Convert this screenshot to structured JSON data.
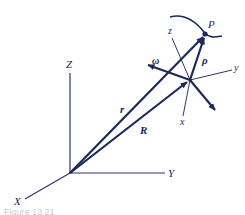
{
  "colors": {
    "ink": "#1c2a5a",
    "thin_line": "#2a3768",
    "background": "#ffffff",
    "caption": "#c9ccd6"
  },
  "fixed_frame": {
    "axes": [
      {
        "label": "X"
      },
      {
        "label": "Y"
      },
      {
        "label": "Z"
      }
    ]
  },
  "moving_frame": {
    "axes": [
      {
        "label": "x"
      },
      {
        "label": "y"
      },
      {
        "label": "z"
      }
    ]
  },
  "vectors": {
    "r": "r",
    "R": "R",
    "rho": "ρ",
    "omega": "ω",
    "R_dot": "R"
  },
  "point": {
    "label": "P"
  },
  "caption": {
    "text": "Figure 13.21"
  }
}
